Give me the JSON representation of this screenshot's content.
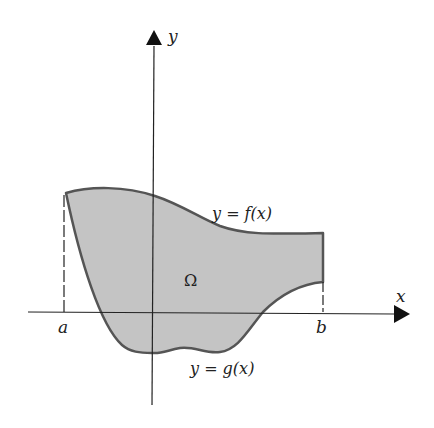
{
  "figure": {
    "type": "region-between-curves",
    "colors": {
      "region_fill": "#c4c4c4",
      "boundary_stroke": "#555555",
      "axis_stroke": "#222222",
      "text": "#222222"
    }
  },
  "axes": {
    "x_label": "x",
    "y_label": "y"
  },
  "labels": {
    "a": "a",
    "b": "b",
    "region": "Ω",
    "upper_curve": "y = f(x)",
    "lower_curve": "y = g(x)"
  }
}
